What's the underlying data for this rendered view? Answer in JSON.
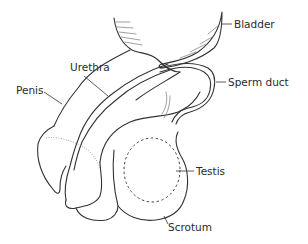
{
  "diagram": {
    "labels": {
      "bladder": "Bladder",
      "urethra": "Urethra",
      "penis": "Penis",
      "sperm_duct": "Sperm duct",
      "testis": "Testis",
      "scrotum": "Scrotum"
    },
    "colors": {
      "line": "#333333",
      "text": "#2a2a2a",
      "background": "#ffffff"
    }
  }
}
